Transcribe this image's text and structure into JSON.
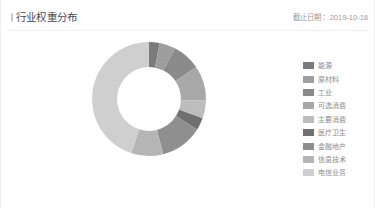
{
  "card": {
    "title": "行业权重分布",
    "title_bullet_icon": "accent-bar-icon",
    "date_label": "截止日期",
    "date_separator": "：",
    "date_value": "2019-10-18"
  },
  "legend": {
    "items": [
      {
        "label": "能源",
        "color": "#7b7b7b"
      },
      {
        "label": "原材料",
        "color": "#9e9e9e"
      },
      {
        "label": "工业",
        "color": "#8a8a8a"
      },
      {
        "label": "可选消费",
        "color": "#a8a8a8"
      },
      {
        "label": "主要消费",
        "color": "#bdbdbd"
      },
      {
        "label": "医疗卫生",
        "color": "#6f6f6f"
      },
      {
        "label": "金融地产",
        "color": "#8f8f8f"
      },
      {
        "label": "信息技术",
        "color": "#b5b5b5"
      },
      {
        "label": "电信业务",
        "color": "#cfcfcf"
      }
    ]
  },
  "chart_data": {
    "type": "pie",
    "variant": "donut",
    "title": "行业权重分布",
    "xlabel": "",
    "ylabel": "",
    "legend_position": "right",
    "grid": false,
    "start_angle_deg": -90,
    "direction": "clockwise",
    "inner_radius_ratio": 0.56,
    "categories": [
      "能源",
      "原材料",
      "工业",
      "可选消费",
      "主要消费",
      "医疗卫生",
      "金融地产",
      "信息技术",
      "电信业务"
    ],
    "values": [
      3.0,
      4.5,
      8.0,
      10.0,
      5.0,
      3.5,
      12.0,
      9.0,
      45.0
    ],
    "unit": "%",
    "colors": [
      "#7b7b7b",
      "#9e9e9e",
      "#8a8a8a",
      "#a8a8a8",
      "#bdbdbd",
      "#6f6f6f",
      "#8f8f8f",
      "#b5b5b5",
      "#cfcfcf"
    ]
  }
}
